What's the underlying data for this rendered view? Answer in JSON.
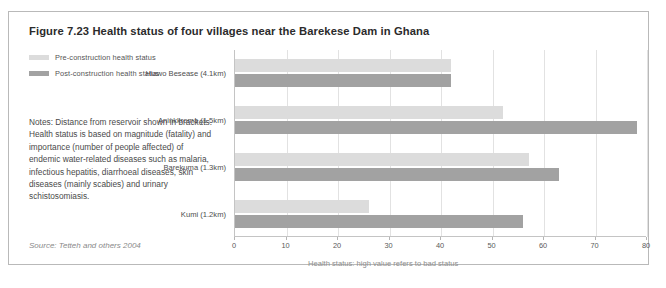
{
  "figure": {
    "title": "Figure 7.23 Health status of four villages near the Barekese Dam in Ghana",
    "notes": "Notes: Distance from reservoir shown in brackets. Health status is based on magnitude (fatality) and importance (number of people affected) of endemic water-related diseases such as malaria, infectious hepatitis, diarrhoeal diseases, skin diseases (mainly scabies) and urinary schistosomiasis.",
    "source": "Source: Tetteh and others 2004"
  },
  "colors": {
    "pre_construction": "#dcdcdc",
    "post_construction": "#a2a2a2",
    "frame_border": "#b9b9b9",
    "gridline": "#e2e2e2",
    "axis": "#c4c4c4"
  },
  "chart_data": {
    "type": "bar",
    "orientation": "horizontal",
    "title": "Figure 7.23 Health status of four villages near the Barekese Dam in Ghana",
    "categories": [
      "Hiawo Besease (4.1km)",
      "Aninkkroma (1.5km)",
      "Barekuma (1.3km)",
      "Kumi (1.2km)"
    ],
    "series": [
      {
        "name": "Pre-construction health status",
        "values": [
          42,
          52,
          57,
          26
        ]
      },
      {
        "name": "Post-construction health status",
        "values": [
          42,
          78,
          63,
          56
        ]
      }
    ],
    "xlabel": "Health status: high value refers to bad status",
    "ylabel": "",
    "xlim": [
      0,
      80
    ],
    "xticks": [
      0,
      10,
      20,
      30,
      40,
      50,
      60,
      70,
      80
    ],
    "xticklabels": [
      "0",
      "10",
      "20",
      "30",
      "40",
      "50",
      "60",
      "70",
      "80"
    ],
    "grid": "vertical",
    "legend_position": "top-left-outside"
  }
}
